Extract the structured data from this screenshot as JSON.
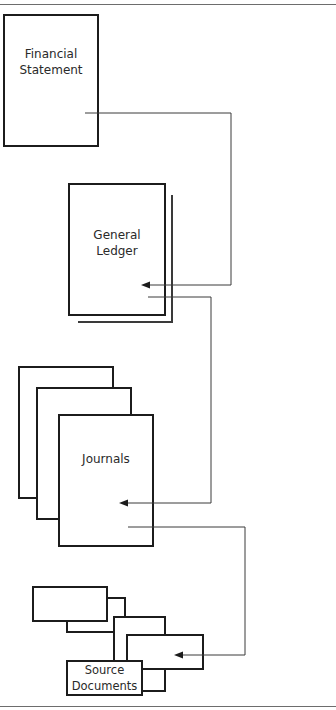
{
  "diagram": {
    "nodes": [
      {
        "id": "financial-statement",
        "label": "Financial\nStatement"
      },
      {
        "id": "general-ledger",
        "label": "General\nLedger"
      },
      {
        "id": "journals",
        "label": "Journals"
      },
      {
        "id": "source-documents",
        "label": "Source\nDocuments"
      }
    ],
    "edges": [
      {
        "from": "financial-statement",
        "to": "general-ledger"
      },
      {
        "from": "general-ledger",
        "to": "journals"
      },
      {
        "from": "journals",
        "to": "source-documents"
      }
    ],
    "colors": {
      "stroke": "#1c1c1c",
      "connector": "#3a3a3a",
      "text": "#2a2a2a",
      "background": "#ffffff"
    }
  }
}
